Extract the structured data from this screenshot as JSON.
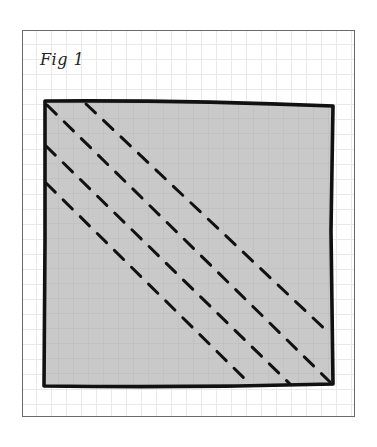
{
  "figure": {
    "caption": "Fig 1",
    "colors": {
      "fill": "#c9c9c9",
      "outline": "#111111",
      "grid": "#e9e9e9",
      "frame": "#6a6a6a"
    },
    "square": {
      "x": 45,
      "y": 102,
      "width": 287,
      "height": 284
    },
    "dashed_lines": [
      {
        "id": "line-1",
        "x1": 86,
        "y1": 104,
        "x2": 330,
        "y2": 334
      },
      {
        "id": "line-2",
        "x1": 47,
        "y1": 105,
        "x2": 330,
        "y2": 382
      },
      {
        "id": "line-3",
        "x1": 46,
        "y1": 146,
        "x2": 290,
        "y2": 384
      },
      {
        "id": "line-4",
        "x1": 46,
        "y1": 183,
        "x2": 251,
        "y2": 385
      }
    ]
  }
}
